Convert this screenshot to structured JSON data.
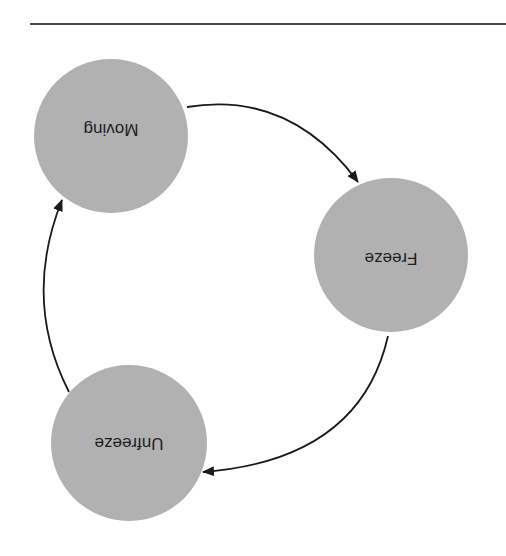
{
  "diagram": {
    "orientation": "rotated-180",
    "colors": {
      "node_fill": "#b1b1b1",
      "edge": "#1a1a1a",
      "rule": "#4a4a4a",
      "text": "#1e1e1e"
    },
    "nodes": [
      {
        "id": "moving",
        "label": "Moving"
      },
      {
        "id": "freeze",
        "label": "Freeze"
      },
      {
        "id": "unfreeze",
        "label": "Unfreeze"
      }
    ],
    "edges": [
      {
        "from": "moving",
        "to": "freeze"
      },
      {
        "from": "freeze",
        "to": "unfreeze"
      },
      {
        "from": "unfreeze",
        "to": "moving"
      }
    ]
  }
}
